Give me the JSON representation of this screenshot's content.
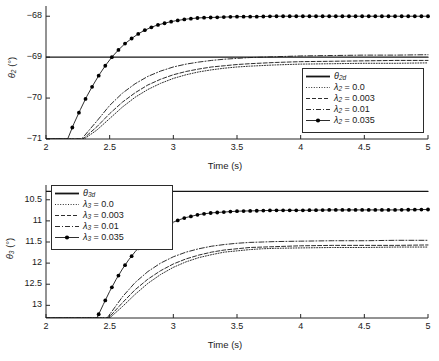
{
  "figure": {
    "panels": [
      {
        "id": "theta2",
        "ylabel_symbol": "θ",
        "ylabel_sub": "2",
        "ylabel_unit": "(°)",
        "xlabel": "Time (s)",
        "xticks": [
          "2",
          "2.5",
          "3",
          "3.5",
          "4",
          "4.5",
          "5"
        ],
        "yticks": [
          "−68",
          "−69",
          "−70",
          "−71"
        ],
        "legend": [
          {
            "label_symbol": "θ",
            "label_sub": "2d",
            "label_rest": "",
            "style": "solid"
          },
          {
            "label_symbol": "λ",
            "label_sub": "2",
            "label_rest": " = 0.0",
            "style": "dotted"
          },
          {
            "label_symbol": "λ",
            "label_sub": "2",
            "label_rest": " = 0.003",
            "style": "dashed"
          },
          {
            "label_symbol": "λ",
            "label_sub": "2",
            "label_rest": " = 0.01",
            "style": "dashdot"
          },
          {
            "label_symbol": "λ",
            "label_sub": "2",
            "label_rest": " = 0.035",
            "style": "marker"
          }
        ]
      },
      {
        "id": "theta3",
        "ylabel_symbol": "θ",
        "ylabel_sub": "3",
        "ylabel_unit": "(°)",
        "xlabel": "Time (s)",
        "xticks": [
          "2",
          "2.5",
          "3",
          "3.5",
          "4",
          "4.5",
          "5"
        ],
        "yticks": [
          "13",
          "12.5",
          "12",
          "11.5",
          "11",
          "10.5"
        ],
        "legend": [
          {
            "label_symbol": "θ",
            "label_sub": "3d",
            "label_rest": "",
            "style": "solid"
          },
          {
            "label_symbol": "λ",
            "label_sub": "3",
            "label_rest": " = 0.0",
            "style": "dotted"
          },
          {
            "label_symbol": "λ",
            "label_sub": "3",
            "label_rest": " = 0.003",
            "style": "dashed"
          },
          {
            "label_symbol": "λ",
            "label_sub": "3",
            "label_rest": " = 0.01",
            "style": "dashdot"
          },
          {
            "label_symbol": "λ",
            "label_sub": "3",
            "label_rest": " = 0.035",
            "style": "marker"
          }
        ]
      }
    ]
  },
  "chart_data": [
    {
      "type": "line",
      "id": "theta2",
      "title": "",
      "xlabel": "Time (s)",
      "ylabel": "θ₂ (°)",
      "xlim": [
        2,
        5
      ],
      "ylim": [
        -71,
        -67.75
      ],
      "xticks": [
        2,
        2.5,
        3,
        3.5,
        4,
        4.5,
        5
      ],
      "yticks": [
        -68,
        -69,
        -70,
        -71
      ],
      "grid": false,
      "legend_position": "lower-right",
      "series": [
        {
          "name": "θ_2d",
          "style": "solid",
          "markers": false,
          "comment": "horizontal desired-value reference line",
          "x": [
            2,
            5
          ],
          "y": [
            -69.0,
            -69.0
          ]
        },
        {
          "name": "λ_2 = 0.0",
          "style": "dotted",
          "markers": false,
          "x": [
            2.0,
            2.3,
            2.4,
            2.5,
            2.6,
            2.7,
            2.8,
            2.9,
            3.0,
            3.1,
            3.2,
            3.3,
            3.4,
            3.5,
            3.6,
            3.8,
            4.0,
            4.25,
            4.5,
            4.75,
            5.0
          ],
          "y": [
            -71.0,
            -71.0,
            -70.78,
            -70.5,
            -70.22,
            -69.98,
            -69.79,
            -69.64,
            -69.52,
            -69.43,
            -69.36,
            -69.31,
            -69.27,
            -69.24,
            -69.22,
            -69.19,
            -69.17,
            -69.16,
            -69.15,
            -69.15,
            -69.14
          ]
        },
        {
          "name": "λ_2 = 0.003",
          "style": "dashed",
          "markers": false,
          "x": [
            2.0,
            2.29,
            2.4,
            2.5,
            2.6,
            2.7,
            2.8,
            2.9,
            3.0,
            3.1,
            3.2,
            3.3,
            3.4,
            3.5,
            3.6,
            3.8,
            4.0,
            4.25,
            4.5,
            4.75,
            5.0
          ],
          "y": [
            -71.0,
            -71.0,
            -70.7,
            -70.38,
            -70.1,
            -69.87,
            -69.68,
            -69.54,
            -69.43,
            -69.35,
            -69.29,
            -69.24,
            -69.21,
            -69.18,
            -69.16,
            -69.13,
            -69.11,
            -69.1,
            -69.09,
            -69.08,
            -69.08
          ]
        },
        {
          "name": "λ_2 = 0.01",
          "style": "dashdot",
          "markers": false,
          "x": [
            2.0,
            2.28,
            2.4,
            2.5,
            2.6,
            2.7,
            2.8,
            2.9,
            3.0,
            3.1,
            3.2,
            3.3,
            3.4,
            3.5,
            3.6,
            3.8,
            4.0,
            4.25,
            4.5,
            4.75,
            5.0
          ],
          "y": [
            -71.0,
            -71.0,
            -70.56,
            -70.18,
            -69.88,
            -69.65,
            -69.47,
            -69.34,
            -69.24,
            -69.17,
            -69.12,
            -69.08,
            -69.05,
            -69.03,
            -69.01,
            -68.99,
            -68.97,
            -68.96,
            -68.95,
            -68.95,
            -68.94
          ]
        },
        {
          "name": "λ_2 = 0.035",
          "style": "solid",
          "markers": true,
          "x": [
            2.0,
            2.17,
            2.22,
            2.27,
            2.32,
            2.37,
            2.42,
            2.47,
            2.52,
            2.57,
            2.62,
            2.67,
            2.72,
            2.77,
            2.82,
            2.87,
            2.92,
            2.97,
            3.02,
            3.1,
            3.2,
            3.3,
            3.4,
            3.5,
            3.65,
            3.8,
            4.0,
            4.25,
            4.5,
            4.75,
            5.0
          ],
          "y": [
            -71.0,
            -71.0,
            -70.62,
            -70.28,
            -69.96,
            -69.68,
            -69.42,
            -69.19,
            -68.99,
            -68.82,
            -68.67,
            -68.55,
            -68.44,
            -68.35,
            -68.28,
            -68.22,
            -68.18,
            -68.14,
            -68.11,
            -68.07,
            -68.04,
            -68.03,
            -68.02,
            -68.01,
            -68.01,
            -68.0,
            -68.0,
            -68.0,
            -68.0,
            -68.0,
            -68.0
          ]
        }
      ]
    },
    {
      "type": "line",
      "id": "theta3",
      "title": "",
      "xlabel": "Time (s)",
      "ylabel": "θ₃ (°)",
      "xlim": [
        2,
        5
      ],
      "ylim": [
        10.2,
        13.35
      ],
      "xticks": [
        2,
        2.5,
        3,
        3.5,
        4,
        4.5,
        5
      ],
      "yticks": [
        10.5,
        11,
        11.5,
        12,
        12.5,
        13
      ],
      "grid": false,
      "legend_position": "upper-left",
      "series": [
        {
          "name": "θ_3d",
          "style": "solid",
          "markers": false,
          "comment": "horizontal desired-value reference line",
          "x": [
            2,
            5
          ],
          "y": [
            13.2,
            13.2
          ]
        },
        {
          "name": "λ_3 = 0.0",
          "style": "dotted",
          "markers": false,
          "x": [
            2.0,
            2.5,
            2.6,
            2.7,
            2.8,
            2.9,
            3.0,
            3.1,
            3.2,
            3.3,
            3.4,
            3.5,
            3.6,
            3.7,
            3.8,
            4.0,
            4.25,
            4.5,
            4.75,
            5.0
          ],
          "y": [
            10.2,
            10.2,
            10.47,
            10.76,
            11.02,
            11.23,
            11.4,
            11.53,
            11.63,
            11.7,
            11.76,
            11.79,
            11.82,
            11.84,
            11.85,
            11.86,
            11.87,
            11.87,
            11.88,
            11.88
          ]
        },
        {
          "name": "λ_3 = 0.003",
          "style": "dashed",
          "markers": false,
          "x": [
            2.0,
            2.49,
            2.6,
            2.7,
            2.8,
            2.9,
            3.0,
            3.1,
            3.2,
            3.3,
            3.4,
            3.5,
            3.6,
            3.7,
            3.8,
            4.0,
            4.25,
            4.5,
            4.75,
            5.0
          ],
          "y": [
            10.2,
            10.2,
            10.56,
            10.87,
            11.12,
            11.32,
            11.48,
            11.6,
            11.69,
            11.76,
            11.81,
            11.84,
            11.87,
            11.88,
            11.89,
            11.91,
            11.92,
            11.92,
            11.92,
            11.93
          ]
        },
        {
          "name": "λ_3 = 0.01",
          "style": "dashdot",
          "markers": false,
          "x": [
            2.0,
            2.48,
            2.6,
            2.7,
            2.8,
            2.9,
            3.0,
            3.1,
            3.2,
            3.3,
            3.4,
            3.5,
            3.6,
            3.7,
            3.8,
            4.0,
            4.25,
            4.5,
            4.75,
            5.0
          ],
          "y": [
            10.2,
            10.2,
            10.7,
            11.04,
            11.3,
            11.5,
            11.65,
            11.76,
            11.84,
            11.9,
            11.94,
            11.97,
            11.99,
            12.0,
            12.01,
            12.02,
            12.03,
            12.03,
            12.04,
            12.04
          ]
        },
        {
          "name": "λ_3 = 0.035",
          "style": "solid",
          "markers": true,
          "x": [
            2.0,
            2.4,
            2.45,
            2.5,
            2.55,
            2.6,
            2.65,
            2.7,
            2.75,
            2.8,
            2.85,
            2.9,
            2.95,
            3.0,
            3.05,
            3.1,
            3.2,
            3.3,
            3.4,
            3.5,
            3.65,
            3.8,
            4.0,
            4.25,
            4.5,
            4.75,
            5.0
          ],
          "y": [
            10.2,
            10.2,
            10.52,
            10.83,
            11.11,
            11.36,
            11.58,
            11.77,
            11.94,
            12.08,
            12.21,
            12.31,
            12.4,
            12.47,
            12.53,
            12.58,
            12.65,
            12.69,
            12.71,
            12.73,
            12.74,
            12.75,
            12.75,
            12.76,
            12.76,
            12.76,
            12.77
          ]
        }
      ]
    }
  ]
}
